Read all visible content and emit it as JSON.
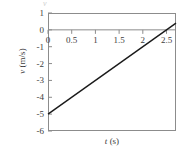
{
  "chart_data": {
    "type": "line",
    "title": "",
    "subtitle": "",
    "xlabel": "t",
    "xlabel_unit": "(s)",
    "ylabel": "v",
    "ylabel_unit": "(m/s)",
    "xlim": [
      0,
      2.7
    ],
    "ylim": [
      -6,
      1
    ],
    "xticks": [
      "0",
      "0.5",
      "1",
      "1.5",
      "2",
      "2.5"
    ],
    "xtick_values": [
      0,
      0.5,
      1,
      1.5,
      2,
      2.5
    ],
    "yticks": [
      "1",
      "0",
      "-1",
      "-2",
      "-3",
      "-4",
      "-5",
      "-6"
    ],
    "ytick_values": [
      1,
      0,
      -1,
      -2,
      -3,
      -4,
      -5,
      -6
    ],
    "grid": false,
    "legend": "none",
    "zero_line": true,
    "series": [
      {
        "name": "velocity",
        "color": "#1a1a1a",
        "x": [
          0,
          2.5,
          2.7
        ],
        "values": [
          -5,
          0,
          0.4
        ],
        "slope": 2,
        "intercept": -5
      }
    ],
    "annotations": []
  },
  "figure": {
    "frame_color": "#8c8c8c",
    "line_color": "#1a1a1a",
    "background": "#ffffff",
    "artifact": "v"
  }
}
